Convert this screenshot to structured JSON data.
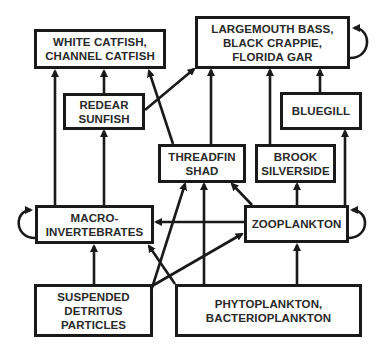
{
  "diagram": {
    "type": "food-web",
    "colors": {
      "stroke": "#1a1a1a",
      "text": "#2a2a2a",
      "background": "#ffffff"
    },
    "nodes": {
      "white_catfish": {
        "label": "WHITE CATFISH,\nCHANNEL CATFISH"
      },
      "largemouth": {
        "label": "LARGEMOUTH BASS,\nBLACK CRAPPIE,\nFLORIDA GAR"
      },
      "redear": {
        "label": "REDEAR\nSUNFISH"
      },
      "bluegill": {
        "label": "BLUEGILL"
      },
      "threadfin": {
        "label": "THREADFIN\nSHAD"
      },
      "brook": {
        "label": "BROOK\nSILVERSIDE"
      },
      "macro": {
        "label": "MACRO-\nINVERTEBRATES"
      },
      "zooplankton": {
        "label": "ZOOPLANKTON"
      },
      "detritus": {
        "label": "SUSPENDED\nDETRITUS\nPARTICLES"
      },
      "phyto": {
        "label": "PHYTOPLANKTON,\nBACTERIOPLANKTON"
      }
    },
    "edges": [
      {
        "from": "macro",
        "to": "white_catfish"
      },
      {
        "from": "redear",
        "to": "white_catfish"
      },
      {
        "from": "threadfin",
        "to": "white_catfish"
      },
      {
        "from": "redear",
        "to": "largemouth"
      },
      {
        "from": "threadfin",
        "to": "largemouth"
      },
      {
        "from": "brook",
        "to": "largemouth"
      },
      {
        "from": "bluegill",
        "to": "largemouth"
      },
      {
        "from": "largemouth",
        "to": "largemouth",
        "self_loop": true
      },
      {
        "from": "macro",
        "to": "redear"
      },
      {
        "from": "zooplankton",
        "to": "bluegill"
      },
      {
        "from": "zooplankton",
        "to": "brook"
      },
      {
        "from": "zooplankton",
        "to": "threadfin"
      },
      {
        "from": "detritus",
        "to": "threadfin"
      },
      {
        "from": "phyto",
        "to": "threadfin"
      },
      {
        "from": "zooplankton",
        "to": "macro"
      },
      {
        "from": "macro",
        "to": "macro",
        "self_loop": true
      },
      {
        "from": "zooplankton",
        "to": "zooplankton",
        "self_loop": true
      },
      {
        "from": "detritus",
        "to": "macro"
      },
      {
        "from": "detritus",
        "to": "zooplankton"
      },
      {
        "from": "phyto",
        "to": "macro"
      },
      {
        "from": "phyto",
        "to": "zooplankton"
      }
    ]
  }
}
